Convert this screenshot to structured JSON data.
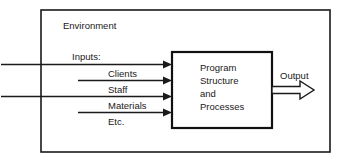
{
  "diagram": {
    "type": "block-flow-diagram",
    "environment_label": "Environment",
    "inputs_label": "Inputs:",
    "input_flows": [
      {
        "label": "Clients"
      },
      {
        "label": "Staff"
      },
      {
        "label": "Materials"
      },
      {
        "label": "Etc."
      }
    ],
    "process_box": {
      "lines": [
        "Program",
        "Structure",
        "and",
        "Processes"
      ]
    },
    "output_label": "Output",
    "colors": {
      "stroke": "#1a1a1a",
      "process_stroke": "#111111",
      "background": "#ffffff",
      "text": "#1a1a1a"
    }
  }
}
